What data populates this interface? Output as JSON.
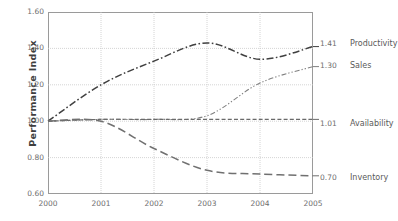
{
  "chart_data": {
    "type": "line",
    "title": "",
    "xlabel": "",
    "ylabel": "Performance Index",
    "x": [
      2000,
      2001,
      2002,
      2003,
      2004,
      2005
    ],
    "categories": [
      "2000",
      "2001",
      "2002",
      "2003",
      "2004",
      "2005"
    ],
    "xlim": [
      2000,
      2005
    ],
    "ylim": [
      0.6,
      1.6
    ],
    "yticks": [
      1.6,
      1.4,
      1.2,
      1.0,
      0.8,
      0.6
    ],
    "ytick_labels": [
      "1.60",
      "1.40",
      "1.20",
      "1.00",
      "0.80",
      "0.60"
    ],
    "xticks": [
      2000,
      2001,
      2002,
      2003,
      2004,
      2005
    ],
    "xtick_labels": [
      "2000",
      "2001",
      "2002",
      "2003",
      "2004",
      "2005"
    ],
    "grid": true,
    "grid_axes": "both",
    "legend_position": "right-of-axes-endpoint-labels",
    "series": [
      {
        "name": "Productivity",
        "end_value": "1.41",
        "line_style": "dash-dot",
        "color": "#404040",
        "values": [
          1.0,
          1.2,
          1.33,
          1.43,
          1.34,
          1.41
        ]
      },
      {
        "name": "Sales",
        "end_value": "1.30",
        "line_style": "dash-dot-dot",
        "color": "#808080",
        "values": [
          1.0,
          1.01,
          1.01,
          1.03,
          1.21,
          1.3
        ]
      },
      {
        "name": "Availability",
        "end_value": "1.01",
        "line_style": "dashed",
        "color": "#6a6a6a",
        "values": [
          1.0,
          1.01,
          1.01,
          1.01,
          1.01,
          1.01
        ]
      },
      {
        "name": "Inventory",
        "end_value": "0.70",
        "line_style": "long-dash",
        "color": "#707070",
        "values": [
          1.0,
          1.0,
          0.85,
          0.73,
          0.71,
          0.7
        ]
      }
    ]
  },
  "axis": {
    "y_title": "Performance Index"
  },
  "colors": {
    "frame": "#9a9a9a",
    "grid": "#c9c9c9",
    "text": "#6e6e6e",
    "title_text": "#3f3f3f",
    "background": "#ffffff"
  }
}
